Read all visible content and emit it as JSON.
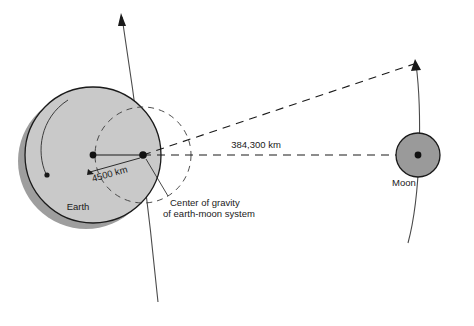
{
  "diagram": {
    "colors": {
      "earth_fill": "#c9c9c9",
      "earth_shadow": "#9e9e9e",
      "moon_fill": "#9a9a9a",
      "outline": "#1a1a1a",
      "arc_line": "#4a4a4a",
      "dash_line": "#1a1a1a",
      "text": "#1a1a1a",
      "background": "#ffffff"
    },
    "labels": {
      "earth": "Earth",
      "moon": "Moon",
      "earth_radius_dim": "4500 km",
      "earth_moon_distance": "384,300 km",
      "barycenter_line1": "Center of gravity",
      "barycenter_line2": "of earth-moon system"
    },
    "bodies": [
      {
        "name": "earth",
        "label": "Earth",
        "center_x": 93,
        "center_y": 155,
        "radius": 68,
        "shadow_offset_x": -7,
        "shadow_offset_y": 6
      },
      {
        "name": "moon",
        "label": "Moon",
        "center_x": 418,
        "center_y": 155,
        "radius": 22
      }
    ],
    "barycenter": {
      "name": "center-of-gravity",
      "x": 143,
      "y": 155,
      "dashed_circle_radius": 48
    },
    "measurements": [
      {
        "name": "earth-center-to-barycenter",
        "value": "4500 km",
        "from_x": 93,
        "from_y": 155,
        "to_x": 143,
        "to_y": 155
      },
      {
        "name": "earth-to-moon",
        "value": "384,300 km",
        "from_x": 143,
        "from_y": 155,
        "to_x": 418,
        "to_y": 155
      }
    ]
  }
}
